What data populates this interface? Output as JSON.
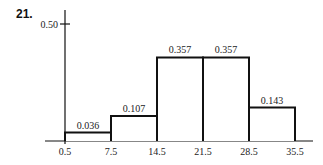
{
  "problem_number": "21.",
  "chart_data": {
    "type": "bar",
    "subtype": "histogram",
    "title": "",
    "xlabel": "",
    "ylabel": "",
    "bin_edges": [
      0.5,
      7.5,
      14.5,
      21.5,
      28.5,
      35.5
    ],
    "bin_edge_labels": [
      "0.5",
      "7.5",
      "14.5",
      "21.5",
      "28.5",
      "35.5"
    ],
    "values": [
      0.036,
      0.107,
      0.357,
      0.357,
      0.143
    ],
    "value_labels": [
      "0.036",
      "0.107",
      "0.357",
      "0.357",
      "0.143"
    ],
    "y_ticks": [
      0.5
    ],
    "y_tick_labels": [
      "0.50"
    ],
    "ylim": [
      0,
      0.5
    ],
    "grid": false,
    "legend": null
  },
  "colors": {
    "bar_outline": "#111111",
    "bar_fill": "#ffffff",
    "axis": "#111111",
    "text": "#222222"
  }
}
